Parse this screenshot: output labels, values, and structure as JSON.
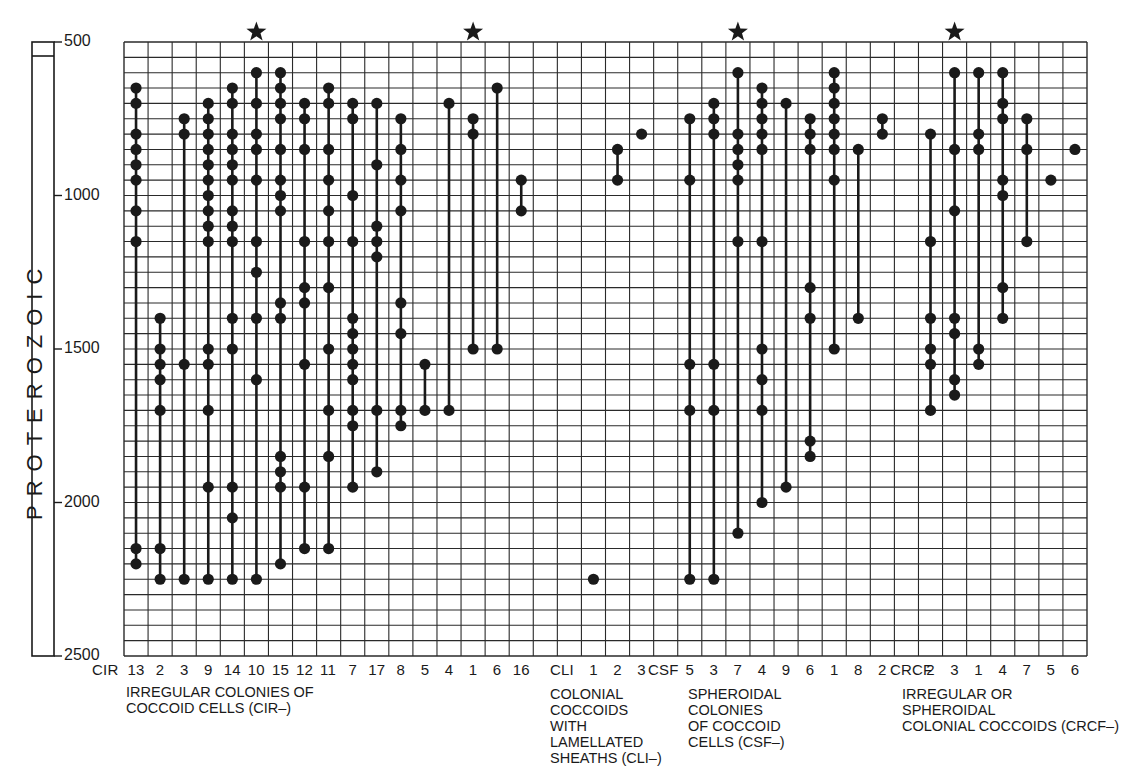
{
  "chart_data": {
    "type": "scatter",
    "subtype": "range-chart",
    "title": "",
    "ylabel": "PROTEROZOIC",
    "yaxis": {
      "range": [
        500,
        2500
      ],
      "inverted": true,
      "ticks": [
        500,
        1000,
        1500,
        2000,
        2500
      ],
      "minor_step": 50,
      "unit": "Ma"
    },
    "grid": true,
    "legend": null,
    "groups": [
      {
        "code": "CIR",
        "label": "IRREGULAR COLONIES OF COCCOID CELLS (CIR–)",
        "label_lines": [
          "IRREGULAR COLONIES OF",
          "COCCOID CELLS (CIR–)"
        ]
      },
      {
        "code": "CLI",
        "label": "COLONIAL COCCOIDS WITH LAMELLATED SHEATHS (CLI–)",
        "label_lines": [
          "COLONIAL",
          "COCCOIDS",
          "WITH",
          "LAMELLATED",
          "SHEATHS (CLI–)"
        ]
      },
      {
        "code": "CSF",
        "label": "SPHEROIDAL COLONIES OF COCCOID CELLS (CSF–)",
        "label_lines": [
          "SPHEROIDAL",
          "COLONIES",
          "OF COCCOID",
          "CELLS (CSF–)"
        ]
      },
      {
        "code": "CRCF",
        "label": "IRREGULAR OR SPHEROIDAL COLONIAL COCCOIDS (CRCF–)",
        "label_lines": [
          "IRREGULAR OR",
          "SPHEROIDAL",
          "COLONIAL COCCOIDS (CRCF–)"
        ]
      }
    ],
    "series": [
      {
        "group": "CIR",
        "name": "13",
        "col": 0,
        "star": false,
        "values": [
          650,
          700,
          800,
          850,
          900,
          950,
          1050,
          1150,
          2150,
          2200
        ]
      },
      {
        "group": "CIR",
        "name": "2",
        "col": 1,
        "star": false,
        "values": [
          1400,
          1500,
          1550,
          1600,
          1700,
          2150,
          2250
        ]
      },
      {
        "group": "CIR",
        "name": "3",
        "col": 2,
        "star": false,
        "values": [
          750,
          800,
          1550,
          2250
        ]
      },
      {
        "group": "CIR",
        "name": "9",
        "col": 3,
        "star": false,
        "values": [
          700,
          750,
          800,
          850,
          900,
          950,
          1000,
          1050,
          1100,
          1150,
          1500,
          1550,
          1700,
          1950,
          2250
        ]
      },
      {
        "group": "CIR",
        "name": "14",
        "col": 4,
        "star": false,
        "values": [
          650,
          700,
          800,
          850,
          900,
          950,
          1050,
          1100,
          1150,
          1400,
          1500,
          1950,
          2050,
          2250
        ]
      },
      {
        "group": "CIR",
        "name": "10",
        "col": 5,
        "star": true,
        "values": [
          600,
          700,
          800,
          850,
          950,
          1150,
          1250,
          1400,
          1600,
          2250
        ]
      },
      {
        "group": "CIR",
        "name": "15",
        "col": 6,
        "star": false,
        "values": [
          600,
          650,
          700,
          750,
          850,
          950,
          1000,
          1050,
          1350,
          1400,
          1850,
          1900,
          1950,
          2200
        ]
      },
      {
        "group": "CIR",
        "name": "12",
        "col": 7,
        "star": false,
        "values": [
          700,
          750,
          850,
          1150,
          1300,
          1350,
          1550,
          1950,
          2150
        ]
      },
      {
        "group": "CIR",
        "name": "11",
        "col": 8,
        "star": false,
        "values": [
          650,
          700,
          850,
          950,
          1050,
          1150,
          1300,
          1500,
          1700,
          1850,
          2150
        ]
      },
      {
        "group": "CIR",
        "name": "7",
        "col": 9,
        "star": false,
        "values": [
          700,
          750,
          1000,
          1150,
          1400,
          1450,
          1500,
          1550,
          1600,
          1700,
          1750,
          1950
        ]
      },
      {
        "group": "CIR",
        "name": "17",
        "col": 10,
        "star": false,
        "values": [
          700,
          900,
          1100,
          1150,
          1200,
          1700,
          1900
        ]
      },
      {
        "group": "CIR",
        "name": "8",
        "col": 11,
        "star": false,
        "values": [
          750,
          850,
          950,
          1050,
          1350,
          1450,
          1700,
          1750
        ]
      },
      {
        "group": "CIR",
        "name": "5",
        "col": 12,
        "star": false,
        "values": [
          1550,
          1700
        ]
      },
      {
        "group": "CIR",
        "name": "4",
        "col": 13,
        "star": false,
        "values": [
          700,
          1700
        ]
      },
      {
        "group": "CIR",
        "name": "1",
        "col": 14,
        "star": true,
        "values": [
          750,
          800,
          1500
        ]
      },
      {
        "group": "CIR",
        "name": "6",
        "col": 15,
        "star": false,
        "values": [
          650,
          1500
        ]
      },
      {
        "group": "CIR",
        "name": "16",
        "col": 16,
        "star": false,
        "values": [
          950,
          1050
        ]
      },
      {
        "group": "CLI",
        "name": "1",
        "col": 19,
        "star": false,
        "values": [
          2250
        ]
      },
      {
        "group": "CLI",
        "name": "2",
        "col": 20,
        "star": false,
        "values": [
          850,
          950
        ]
      },
      {
        "group": "CLI",
        "name": "3",
        "col": 21,
        "star": false,
        "values": [
          800
        ]
      },
      {
        "group": "CSF",
        "name": "5",
        "col": 23,
        "star": false,
        "values": [
          750,
          950,
          1550,
          1700,
          2250
        ]
      },
      {
        "group": "CSF",
        "name": "3",
        "col": 24,
        "star": false,
        "values": [
          700,
          750,
          800,
          1550,
          1700,
          2250
        ]
      },
      {
        "group": "CSF",
        "name": "7",
        "col": 25,
        "star": true,
        "values": [
          600,
          800,
          850,
          900,
          950,
          1150,
          2100
        ]
      },
      {
        "group": "CSF",
        "name": "4",
        "col": 26,
        "star": false,
        "values": [
          650,
          700,
          750,
          800,
          850,
          1150,
          1500,
          1600,
          1700,
          2000
        ]
      },
      {
        "group": "CSF",
        "name": "9",
        "col": 27,
        "star": false,
        "values": [
          700,
          1950
        ]
      },
      {
        "group": "CSF",
        "name": "6",
        "col": 28,
        "star": false,
        "values": [
          750,
          800,
          850,
          1300,
          1400,
          1800,
          1850
        ]
      },
      {
        "group": "CSF",
        "name": "1",
        "col": 29,
        "star": false,
        "values": [
          600,
          650,
          700,
          750,
          800,
          850,
          950,
          1500
        ]
      },
      {
        "group": "CSF",
        "name": "8",
        "col": 30,
        "star": false,
        "values": [
          850,
          1400
        ]
      },
      {
        "group": "CSF",
        "name": "2",
        "col": 31,
        "star": false,
        "values": [
          750,
          800
        ]
      },
      {
        "group": "CRCF",
        "name": "2",
        "col": 33,
        "star": false,
        "values": [
          800,
          1150,
          1400,
          1500,
          1550,
          1700
        ]
      },
      {
        "group": "CRCF",
        "name": "3",
        "col": 34,
        "star": true,
        "values": [
          600,
          850,
          1050,
          1400,
          1450,
          1600,
          1650
        ]
      },
      {
        "group": "CRCF",
        "name": "1",
        "col": 35,
        "star": false,
        "values": [
          600,
          800,
          850,
          1500,
          1550
        ]
      },
      {
        "group": "CRCF",
        "name": "4",
        "col": 36,
        "star": false,
        "values": [
          600,
          700,
          750,
          950,
          1000,
          1300,
          1400
        ]
      },
      {
        "group": "CRCF",
        "name": "7",
        "col": 37,
        "star": false,
        "values": [
          750,
          850,
          1150
        ]
      },
      {
        "group": "CRCF",
        "name": "5",
        "col": 38,
        "star": false,
        "values": [
          950
        ]
      },
      {
        "group": "CRCF",
        "name": "6",
        "col": 39,
        "star": false,
        "values": [
          850
        ]
      }
    ]
  },
  "axis": {
    "era_label": "PROTEROZOIC",
    "ticks": [
      "500",
      "1000",
      "1500",
      "2000",
      "2500"
    ]
  },
  "x_labels": {
    "CIR": "CIR",
    "CLI": "CLI",
    "CSF": "CSF",
    "CRCF": "CRCF"
  },
  "colors": {
    "ink": "#1a1a1a",
    "grid": "#2a2a2a",
    "background": "#ffffff"
  }
}
